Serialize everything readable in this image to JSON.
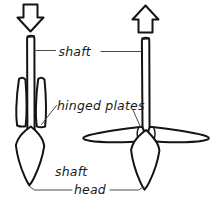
{
  "figure": {
    "title": "Shaft with hinged plates — closed and deployed states",
    "background_color": "#ffffff",
    "ink_color": "#141414",
    "leader_color": "#4a4a4a"
  },
  "labels": {
    "shaft": "shaft",
    "hinged_plates": "hinged plates",
    "shaft_head_line1": "shaft",
    "shaft_head_line2": "head"
  },
  "arrows": [
    {
      "name": "down-arrow",
      "direction": "down",
      "meaning": "insertion / push in",
      "over_figure": "closed"
    },
    {
      "name": "up-arrow",
      "direction": "up",
      "meaning": "withdrawal / pull out",
      "over_figure": "open"
    }
  ],
  "figures": [
    {
      "name": "closed-assembly",
      "state": "closed",
      "description": "Shaft with hinged plates folded flat alongside the shaft",
      "parts": [
        "shaft",
        "hinged plates (closed)",
        "shaft head"
      ]
    },
    {
      "name": "open-assembly",
      "state": "open",
      "description": "Shaft with hinged plates swung out horizontally",
      "parts": [
        "shaft",
        "hinged plates (open)",
        "shaft head"
      ]
    }
  ]
}
